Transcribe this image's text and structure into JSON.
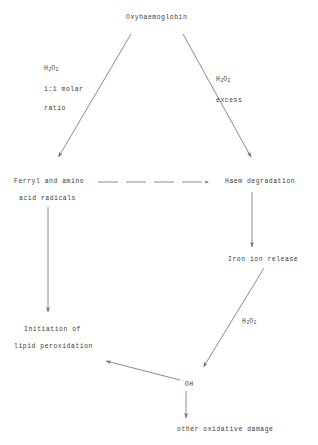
{
  "diagram": {
    "title_node": "Oxyhaemoglobin",
    "nodes": [
      {
        "id": "oxyhaemoglobin",
        "label": "Oxyhaemoglobin",
        "x": 126,
        "y": 14
      },
      {
        "id": "ferryl-radicals-line1",
        "label": "Ferryl and amino",
        "x": 14,
        "y": 178
      },
      {
        "id": "ferryl-radicals-line2",
        "label": "acid radicals",
        "x": 19,
        "y": 195
      },
      {
        "id": "haem-degradation",
        "label": "Haem degradation",
        "x": 225,
        "y": 178
      },
      {
        "id": "iron-ion-release",
        "label": "Iron ion release",
        "x": 228,
        "y": 256
      },
      {
        "id": "lipid-peroxidation-line1",
        "label": "Initiation of",
        "x": 24,
        "y": 326
      },
      {
        "id": "lipid-peroxidation-line2",
        "label": "lipid peroxidation",
        "x": 14,
        "y": 343
      },
      {
        "id": "hydroxyl-radical",
        "label": "OH",
        "radical_prefix": "˙",
        "x": 181,
        "y": 379
      },
      {
        "id": "other-oxidative-damage",
        "label": "other oxidative damage",
        "x": 177,
        "y": 426
      }
    ],
    "edge_labels": [
      {
        "id": "left-branch-label",
        "lines": [
          "H2O2",
          "1:1 molar",
          "ratio"
        ],
        "formula": {
          "base1": "H",
          "sub1": "2",
          "base2": "O",
          "sub2": "2"
        },
        "x": 44,
        "y": 65
      },
      {
        "id": "right-branch-label",
        "lines": [
          "H2O2",
          "excess"
        ],
        "formula": {
          "base1": "H",
          "sub1": "2",
          "base2": "O",
          "sub2": "2"
        },
        "x": 216,
        "y": 76
      },
      {
        "id": "fenton-label",
        "lines": [
          "H2O2"
        ],
        "formula": {
          "base1": "H",
          "sub1": "2",
          "base2": "O",
          "sub2": "2"
        },
        "x": 242,
        "y": 318
      }
    ],
    "edges": [
      {
        "id": "oxyhb-to-ferryl",
        "style": "solid",
        "from": "oxyhaemoglobin",
        "to": "ferryl-radicals"
      },
      {
        "id": "oxyhb-to-haem",
        "style": "solid",
        "from": "oxyhaemoglobin",
        "to": "haem-degradation"
      },
      {
        "id": "ferryl-to-haem",
        "style": "dashed",
        "from": "ferryl-radicals",
        "to": "haem-degradation"
      },
      {
        "id": "ferryl-to-lipid",
        "style": "solid",
        "from": "ferryl-radicals",
        "to": "lipid-peroxidation"
      },
      {
        "id": "haem-to-iron",
        "style": "solid",
        "from": "haem-degradation",
        "to": "iron-ion-release"
      },
      {
        "id": "iron-to-hydroxyl",
        "style": "solid",
        "from": "iron-ion-release",
        "to": "hydroxyl-radical"
      },
      {
        "id": "hydroxyl-to-lipid",
        "style": "solid",
        "from": "hydroxyl-radical",
        "to": "lipid-peroxidation"
      },
      {
        "id": "hydroxyl-to-damage",
        "style": "solid",
        "from": "hydroxyl-radical",
        "to": "other-oxidative-damage"
      }
    ],
    "colors": {
      "background": "#ffffff",
      "line": "#6e6e6e",
      "text": "#3a3a3a"
    }
  }
}
